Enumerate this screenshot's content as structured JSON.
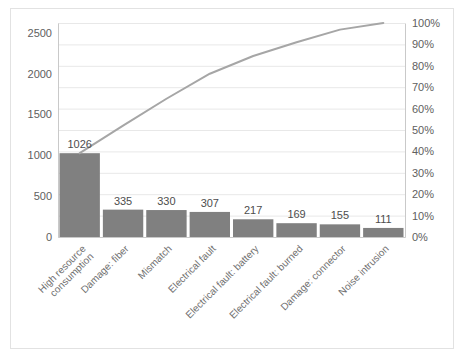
{
  "chart_data": {
    "type": "bar",
    "title": "",
    "subtitle": "",
    "xlabel": "",
    "ylabel": "",
    "categories": [
      "High resource consumption",
      "Damage: fiber",
      "Mismatch",
      "Electrical fault",
      "Electrical fault: battery",
      "Electrical fault: burned",
      "Damage: connector",
      "Noise intrusion"
    ],
    "category_lines": [
      [
        "High resource",
        "consumption"
      ],
      [
        "Damage: fiber"
      ],
      [
        "Mismatch"
      ],
      [
        "Electrical fault"
      ],
      [
        "Electrical fault: battery"
      ],
      [
        "Electrical fault: burned"
      ],
      [
        "Damage: connector"
      ],
      [
        "Noise intrusion"
      ]
    ],
    "values": [
      1026,
      335,
      330,
      307,
      217,
      169,
      155,
      111
    ],
    "value_labels": [
      "1026",
      "335",
      "330",
      "307",
      "217",
      "169",
      "155",
      "111"
    ],
    "cumulative_percent": [
      39.2,
      52.0,
      64.6,
      76.3,
      84.6,
      91.0,
      96.9,
      100.0
    ],
    "series": [
      {
        "name": "Count",
        "type": "bar",
        "values": [
          1026,
          335,
          330,
          307,
          217,
          169,
          155,
          111
        ]
      },
      {
        "name": "Cumulative %",
        "type": "line",
        "values": [
          39.2,
          52.0,
          64.6,
          76.3,
          84.6,
          91.0,
          96.9,
          100.0
        ]
      }
    ],
    "ylim": [
      0,
      2620
    ],
    "y_ticks": [
      0,
      500,
      1000,
      1500,
      2000,
      2500
    ],
    "y_tick_labels": [
      "0",
      "500",
      "1000",
      "1500",
      "2000",
      "2500"
    ],
    "ylim_secondary": [
      0,
      100
    ],
    "y2_ticks": [
      0,
      10,
      20,
      30,
      40,
      50,
      60,
      70,
      80,
      90,
      100
    ],
    "y2_tick_labels": [
      "0%",
      "10%",
      "20%",
      "30%",
      "40%",
      "50%",
      "60%",
      "70%",
      "80%",
      "90%",
      "100%"
    ],
    "grid": true,
    "legend": "none",
    "colors": {
      "bar": "#808080",
      "line": "#a6a6a6",
      "grid": "#e8e8e8",
      "axis": "#c9c9c9",
      "text": "#606060",
      "border": "#e2e2e2",
      "background": "#ffffff"
    }
  }
}
